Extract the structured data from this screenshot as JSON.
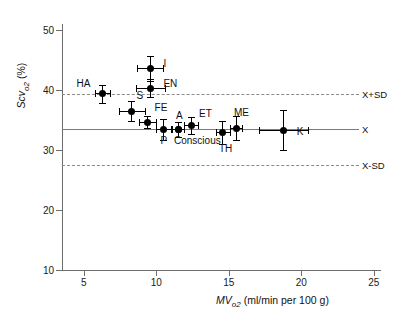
{
  "chart_data": {
    "type": "scatter",
    "title": "",
    "xlabel": "MVo2 (ml/min per 100 g)",
    "ylabel": "Scvo2 (%)",
    "xlim": [
      3.5,
      25.5
    ],
    "ylim": [
      10,
      51
    ],
    "xticks": [
      5,
      10,
      15,
      20,
      25
    ],
    "yticks": [
      10,
      20,
      30,
      40,
      50
    ],
    "grid": false,
    "legend": false,
    "reference_lines": [
      {
        "label": "X+SD",
        "value": 39.4,
        "style": "dashed"
      },
      {
        "label": "X",
        "value": 33.5,
        "style": "solid"
      },
      {
        "label": "X-SD",
        "value": 27.5,
        "style": "dashed"
      }
    ],
    "points": [
      {
        "label": "I",
        "x": 9.6,
        "y": 43.6,
        "xerr": 0.9,
        "yerr": 2.1,
        "label_dx": 13,
        "label_dy": -4
      },
      {
        "label": "EN",
        "x": 9.6,
        "y": 40.3,
        "xerr": 1.0,
        "yerr": 1.5,
        "label_dx": 13,
        "label_dy": -4
      },
      {
        "label": "HA",
        "x": 6.3,
        "y": 39.4,
        "xerr": 0.5,
        "yerr": 1.5,
        "label_dx": -26,
        "label_dy": -10
      },
      {
        "label": "S",
        "x": 8.3,
        "y": 36.5,
        "xerr": 0.9,
        "yerr": 1.6,
        "label_dx": 5,
        "label_dy": -15
      },
      {
        "label": "FE",
        "x": 9.4,
        "y": 34.6,
        "xerr": 0.6,
        "yerr": 1.0,
        "label_dx": 7,
        "label_dy": -14
      },
      {
        "label": "P",
        "x": 10.5,
        "y": 33.4,
        "xerr": 0.5,
        "yerr": 1.7,
        "label_dx": -3,
        "label_dy": 11
      },
      {
        "label": "Conscious",
        "x": 11.5,
        "y": 33.4,
        "xerr": 0.4,
        "yerr": 1.2,
        "label_dx": -4,
        "label_dy": 11
      },
      {
        "label": "A",
        "x": 11.5,
        "y": 33.4,
        "xerr": 0.0,
        "yerr": 0.0,
        "label_dx": -2,
        "label_dy": -14
      },
      {
        "label": "ET",
        "x": 12.4,
        "y": 34.1,
        "xerr": 0.5,
        "yerr": 1.4,
        "label_dx": 8,
        "label_dy": -11
      },
      {
        "label": "TH",
        "x": 14.6,
        "y": 32.9,
        "xerr": 0.5,
        "yerr": 1.9,
        "label_dx": -4,
        "label_dy": 16
      },
      {
        "label": "ME",
        "x": 15.5,
        "y": 33.6,
        "xerr": 0.4,
        "yerr": 2.0,
        "label_dx": -2,
        "label_dy": -15
      },
      {
        "label": "K",
        "x": 18.8,
        "y": 33.3,
        "xerr": 1.7,
        "yerr": 3.3,
        "label_dx": 13,
        "label_dy": 2
      }
    ]
  }
}
